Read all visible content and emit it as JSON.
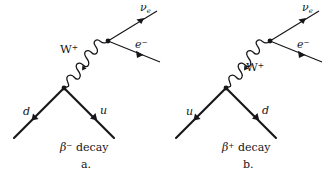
{
  "figure": {
    "background_color": "#ffffff",
    "line_color": "#16161a",
    "width": 333,
    "height": 179
  },
  "diagrams": [
    {
      "id": "beta-minus",
      "caption": "decay",
      "caption_symbol": "β",
      "caption_charge": "−",
      "panel_letter": "a.",
      "labels": {
        "neutrino": "ν",
        "neutrino_sub": "e",
        "electron": "e",
        "electron_charge": "−",
        "boson": "W",
        "boson_charge": "+",
        "quark_in": "d",
        "quark_out": "u"
      }
    },
    {
      "id": "beta-plus",
      "caption": "decay",
      "caption_symbol": "β",
      "caption_charge": "+",
      "panel_letter": "b.",
      "labels": {
        "neutrino": "ν",
        "neutrino_sub": "e",
        "electron": "e",
        "electron_charge": "−",
        "boson": "W",
        "boson_charge": "+",
        "quark_in": "u",
        "quark_out": "d"
      }
    }
  ]
}
